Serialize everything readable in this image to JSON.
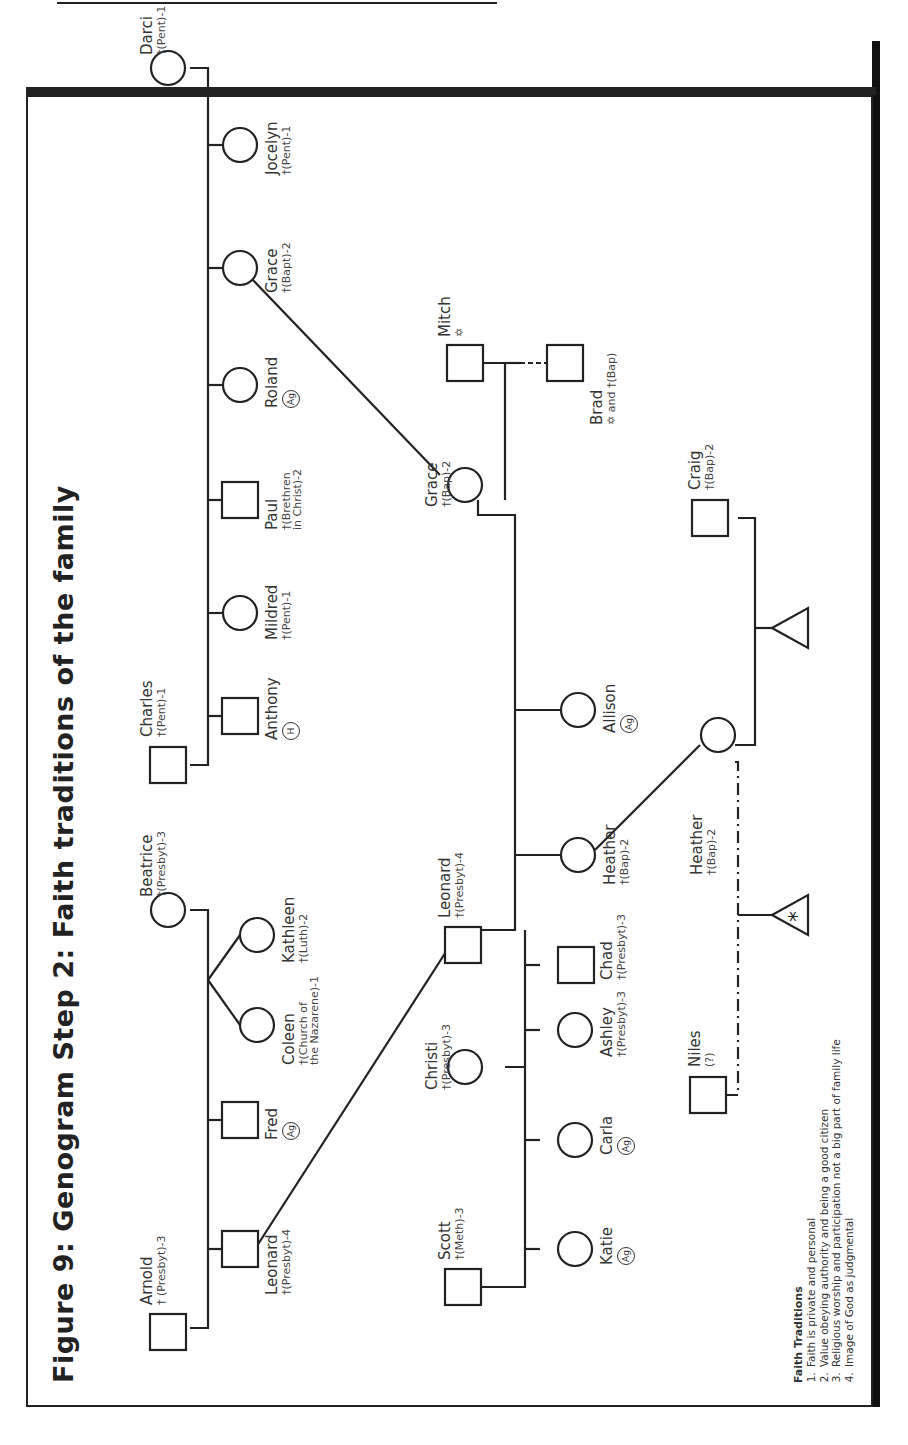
{
  "title": "Figure 9: Genogram Step 2: Faith traditions of the family",
  "legend": {
    "title": "Faith Traditions",
    "items": [
      "Faith is private and personal",
      "Value obeying authority and being a good citizen",
      "Religious worship and participation not a big part of family life",
      "Image of God as judgmental"
    ]
  },
  "people": {
    "arnold": {
      "name": "Arnold",
      "faith": "† (Presbyt)-3",
      "shape": "square"
    },
    "beatrice": {
      "name": "Beatrice",
      "faith": "†(Presbyt)-3",
      "shape": "circle"
    },
    "leonard_g2": {
      "name": "Leonard",
      "faith": "†(Presbyt)-4",
      "shape": "square"
    },
    "fred": {
      "name": "Fred",
      "badge": "Ag",
      "shape": "square"
    },
    "coleen": {
      "name": "Coleen",
      "faith": "†(Church of the Nazarene)-1",
      "faith_line1": "†(Church of",
      "faith_line2": "the Nazarene)-1",
      "shape": "circle"
    },
    "kathleen": {
      "name": "Kathleen",
      "faith": "†(Luth)-2",
      "shape": "circle"
    },
    "charles": {
      "name": "Charles",
      "faith": "†(Pent)-1",
      "shape": "square"
    },
    "darci": {
      "name": "Darci",
      "faith": "†(Pent)-1",
      "shape": "circle"
    },
    "anthony": {
      "name": "Anthony",
      "badge": "H",
      "shape": "square"
    },
    "mildred": {
      "name": "Mildred",
      "faith": "†(Pent)-1",
      "shape": "circle"
    },
    "paul": {
      "name": "Paul",
      "faith": "†(Brethren in Christ)-2",
      "faith_line1": "†(Brethren",
      "faith_line2": "in Christ)-2",
      "shape": "square"
    },
    "roland": {
      "name": "Roland",
      "badge": "Ag",
      "shape": "circle"
    },
    "grace_g2": {
      "name": "Grace",
      "faith": "†(Bapt)-2",
      "shape": "circle"
    },
    "jocelyn": {
      "name": "Jocelyn",
      "faith": "†(Pent)-1",
      "shape": "circle"
    },
    "scott": {
      "name": "Scott",
      "faith": "†(Meth)-3",
      "shape": "square"
    },
    "christi": {
      "name": "Christi",
      "faith": "†(Presbyt)-3",
      "shape": "circle"
    },
    "leonard_g3": {
      "name": "Leonard",
      "faith": "†(Presbyt)-4",
      "shape": "square"
    },
    "grace_g3": {
      "name": "Grace",
      "faith": "†(Bap)-2",
      "shape": "circle"
    },
    "mitch": {
      "name": "Mitch",
      "faith": "✡",
      "shape": "square"
    },
    "brad": {
      "name": "Brad",
      "faith": "✡ and †(Bap)",
      "shape": "square"
    },
    "katie": {
      "name": "Katie",
      "badge": "Ag",
      "shape": "circle"
    },
    "carla": {
      "name": "Carla",
      "badge": "Ag",
      "shape": "circle"
    },
    "ashley": {
      "name": "Ashley",
      "faith": "†(Presbyt)-3",
      "shape": "circle"
    },
    "chad": {
      "name": "Chad",
      "faith": "†(Presbyt)-3",
      "shape": "square"
    },
    "heather_g4": {
      "name": "Heather",
      "faith": "†(Bap)-2",
      "shape": "circle"
    },
    "allison": {
      "name": "Allison",
      "badge": "Ag",
      "shape": "circle"
    },
    "heather_g5": {
      "name": "Heather",
      "faith": "†(Bap)-2",
      "shape": "circle"
    },
    "niles": {
      "name": "Niles",
      "faith": "(?)",
      "shape": "square"
    },
    "craig": {
      "name": "Craig",
      "faith": "†(Bap)-2",
      "shape": "square"
    },
    "pregnancy_heather_craig": {
      "symbol": "triangle"
    },
    "pregnancy_heather_niles": {
      "symbol": "triangle",
      "mark": "*"
    }
  }
}
